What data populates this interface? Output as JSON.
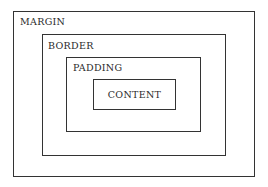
{
  "diagram": {
    "layers": [
      {
        "name": "margin",
        "label": "MARGIN"
      },
      {
        "name": "border",
        "label": "BORDER"
      },
      {
        "name": "padding",
        "label": "PADDING"
      },
      {
        "name": "content",
        "label": "CONTENT"
      }
    ],
    "line_color": "#333333",
    "background": "#ffffff"
  }
}
